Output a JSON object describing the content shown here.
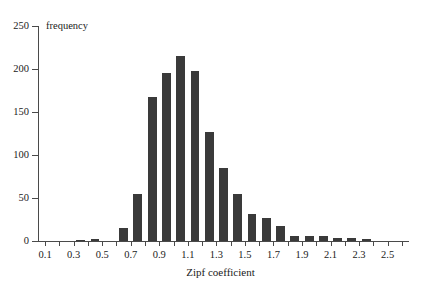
{
  "chart_data": {
    "type": "bar",
    "title": "",
    "subtitle": "",
    "xlabel": "Zipf coefficient",
    "ylabel": "frequency",
    "ylim": [
      0,
      250
    ],
    "xlim": [
      0.05,
      2.65
    ],
    "grid": false,
    "legend": null,
    "bar_color": "#3a3a3a",
    "bin_width": 0.1,
    "y_ticks": [
      0,
      50,
      100,
      150,
      200,
      250
    ],
    "y_tick_labels": [
      "0",
      "50",
      "100",
      "150",
      "200",
      "250"
    ],
    "x_ticks": [
      0.1,
      0.2,
      0.3,
      0.4,
      0.5,
      0.6,
      0.7,
      0.8,
      0.9,
      1.0,
      1.1,
      1.2,
      1.3,
      1.4,
      1.5,
      1.6,
      1.7,
      1.8,
      1.9,
      2.0,
      2.1,
      2.2,
      2.3,
      2.4,
      2.5,
      2.6
    ],
    "x_tick_labels": [
      {
        "value": 0.1,
        "label": "0.1"
      },
      {
        "value": 0.3,
        "label": "0.3"
      },
      {
        "value": 0.5,
        "label": "0.5"
      },
      {
        "value": 0.7,
        "label": "0.7"
      },
      {
        "value": 0.9,
        "label": "0.9"
      },
      {
        "value": 1.1,
        "label": "1.1"
      },
      {
        "value": 1.3,
        "label": "1.3"
      },
      {
        "value": 1.5,
        "label": "1.5"
      },
      {
        "value": 1.7,
        "label": "1.7"
      },
      {
        "value": 1.9,
        "label": "1.9"
      },
      {
        "value": 2.1,
        "label": "2.1"
      },
      {
        "value": 2.3,
        "label": "2.3"
      },
      {
        "value": 2.5,
        "label": "2.5"
      }
    ],
    "categories": [
      0.1,
      0.2,
      0.3,
      0.4,
      0.5,
      0.6,
      0.7,
      0.8,
      0.9,
      1.0,
      1.1,
      1.2,
      1.3,
      1.4,
      1.5,
      1.6,
      1.7,
      1.8,
      1.9,
      2.0,
      2.1,
      2.2,
      2.3,
      2.4
    ],
    "values": [
      0,
      0,
      1,
      2,
      0,
      15,
      55,
      167,
      195,
      215,
      198,
      127,
      85,
      55,
      31,
      27,
      18,
      6,
      6,
      6,
      4,
      3,
      2,
      0
    ]
  }
}
